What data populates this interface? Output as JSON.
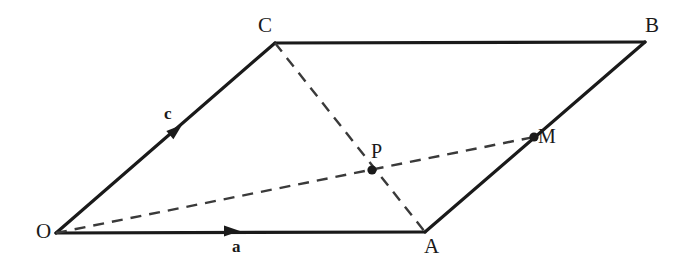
{
  "figure": {
    "type": "geometry-diagram",
    "shape": "parallelogram",
    "background_color": "#ffffff",
    "stroke_color": "#1a1a1a",
    "dashed_color": "#3a3a3a",
    "width": 692,
    "height": 261
  },
  "vertices": [
    {
      "id": "O",
      "label": "O",
      "x": 56,
      "y": 233,
      "label_x": 36,
      "label_y": 221
    },
    {
      "id": "A",
      "label": "A",
      "x": 425,
      "y": 232,
      "label_x": 424,
      "label_y": 236
    },
    {
      "id": "B",
      "label": "B",
      "x": 645,
      "y": 42,
      "label_x": 645,
      "label_y": 15
    },
    {
      "id": "C",
      "label": "C",
      "x": 275,
      "y": 43,
      "label_x": 258,
      "label_y": 15
    }
  ],
  "points": [
    {
      "id": "P",
      "label": "P",
      "x": 372,
      "y": 170,
      "label_x": 371,
      "label_y": 141,
      "description": "intersection of OM and CA"
    },
    {
      "id": "M",
      "label": "M",
      "x": 534,
      "y": 137,
      "label_x": 538,
      "label_y": 126,
      "description": "midpoint of AB"
    }
  ],
  "solid_edges": [
    {
      "id": "OA",
      "from": "O",
      "to": "A"
    },
    {
      "id": "OC",
      "from": "O",
      "to": "C"
    },
    {
      "id": "CB",
      "from": "C",
      "to": "B"
    },
    {
      "id": "AB",
      "from": "A",
      "to": "B"
    }
  ],
  "dashed_edges": [
    {
      "id": "CA",
      "from": "C",
      "to": "A"
    },
    {
      "id": "OM",
      "from": "O",
      "to": "M"
    }
  ],
  "vectors": [
    {
      "id": "a",
      "label": "a",
      "along": "OA",
      "arrow_x": 232,
      "arrow_y": 231,
      "angle_deg": 0,
      "label_x": 232,
      "label_y": 238
    },
    {
      "id": "c",
      "label": "c",
      "along": "OC",
      "arrow_x": 176,
      "arrow_y": 130,
      "angle_deg": -40,
      "label_x": 164,
      "label_y": 105
    }
  ]
}
